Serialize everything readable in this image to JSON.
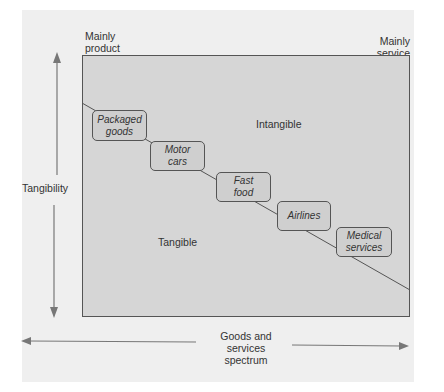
{
  "diagram": {
    "corner_labels": {
      "top_left": [
        "Mainly",
        "product"
      ],
      "top_right": [
        "Mainly",
        "service"
      ]
    },
    "region_labels": {
      "upper": "Intangible",
      "lower": "Tangible"
    },
    "axes": {
      "vertical": "Tangibility",
      "horizontal": [
        "Goods and",
        "services",
        "spectrum"
      ]
    },
    "items": [
      {
        "lines": [
          "Packaged",
          "goods"
        ]
      },
      {
        "lines": [
          "Motor",
          "cars"
        ]
      },
      {
        "lines": [
          "Fast",
          "food"
        ]
      },
      {
        "lines": [
          "Airlines"
        ]
      },
      {
        "lines": [
          "Medical",
          "services"
        ]
      }
    ],
    "colors": {
      "background": "#ffffff",
      "card": "#efefef",
      "plot": "#d6d6d6",
      "line": "#555555",
      "arrow": "#777777"
    }
  }
}
